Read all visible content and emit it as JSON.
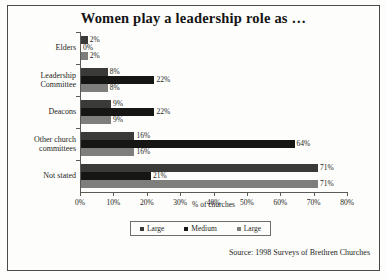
{
  "chart_data": {
    "type": "bar",
    "orientation": "horizontal",
    "title": "Women play a leadership role as …",
    "xlabel": "% of churches",
    "ylabel": "",
    "xlim": [
      0,
      80
    ],
    "xticks": [
      "0%",
      "10%",
      "20%",
      "30%",
      "40%",
      "50%",
      "60%",
      "70%",
      "80%"
    ],
    "xtick_values": [
      0,
      10,
      20,
      30,
      40,
      50,
      60,
      70,
      80
    ],
    "grid": false,
    "legend_position": "bottom",
    "categories": [
      "Elders",
      "Leadership\nCommittee",
      "Deacons",
      "Other church\ncommittees",
      "Not stated"
    ],
    "series": [
      {
        "name": "Large",
        "color": "#3a3a38",
        "values": [
          2,
          8,
          9,
          16,
          71
        ],
        "labels": [
          "2%",
          "8%",
          "9%",
          "16%",
          "71%"
        ]
      },
      {
        "name": "Medium",
        "color": "#161614",
        "values": [
          0,
          22,
          22,
          64,
          21
        ],
        "labels": [
          "0%",
          "22%",
          "22%",
          "64%",
          "21%"
        ]
      },
      {
        "name": "Large",
        "color": "#7e7e7a",
        "values": [
          2,
          8,
          9,
          16,
          71
        ],
        "labels": [
          "2%",
          "8%",
          "9%",
          "16%",
          "71%"
        ]
      }
    ],
    "source": "Source: 1998 Surveys of Brethren Churches"
  },
  "legend": {
    "entries": [
      {
        "label": "Large"
      },
      {
        "label": "Medium"
      },
      {
        "label": "Large"
      }
    ]
  }
}
